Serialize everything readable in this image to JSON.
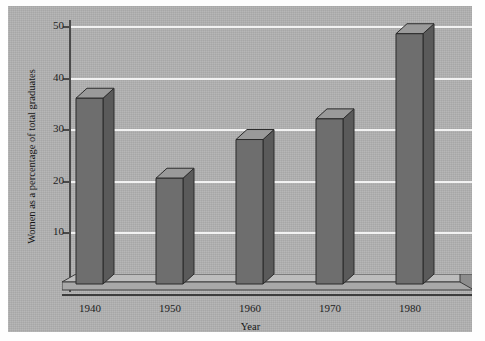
{
  "chart_data": {
    "type": "bar",
    "title": "",
    "subtitle": "",
    "xlabel": "Year",
    "ylabel": "Women as a percentage of total graduates",
    "categories": [
      "1940",
      "1950",
      "1960",
      "1970",
      "1980"
    ],
    "values": [
      36,
      20.5,
      28,
      32,
      48.5
    ],
    "series": [
      {
        "name": "Women as a percentage of total graduates",
        "values": [
          36,
          20.5,
          28,
          32,
          48.5
        ]
      }
    ],
    "ylim": [
      0,
      52
    ],
    "xlim": [
      0,
      5
    ],
    "yticks": [
      10,
      20,
      30,
      40,
      50
    ],
    "ytick_labels": [
      "10",
      "20",
      "30",
      "40",
      "50"
    ],
    "grid": true,
    "grid_axis": "y",
    "grid_color": "#f2f2f2",
    "legend": false,
    "legend_position": "none",
    "style": "3d-bar",
    "colors": {
      "panel_background": "#b2b2b2",
      "figure_background": "#fefefe",
      "bar_front": "#6e6e6e",
      "bar_top": "#9a9a9a",
      "bar_side": "#5a5a5a",
      "bar_outline": "#2b2b2b",
      "axis": "#3c3c3c",
      "text": "#141414"
    }
  }
}
